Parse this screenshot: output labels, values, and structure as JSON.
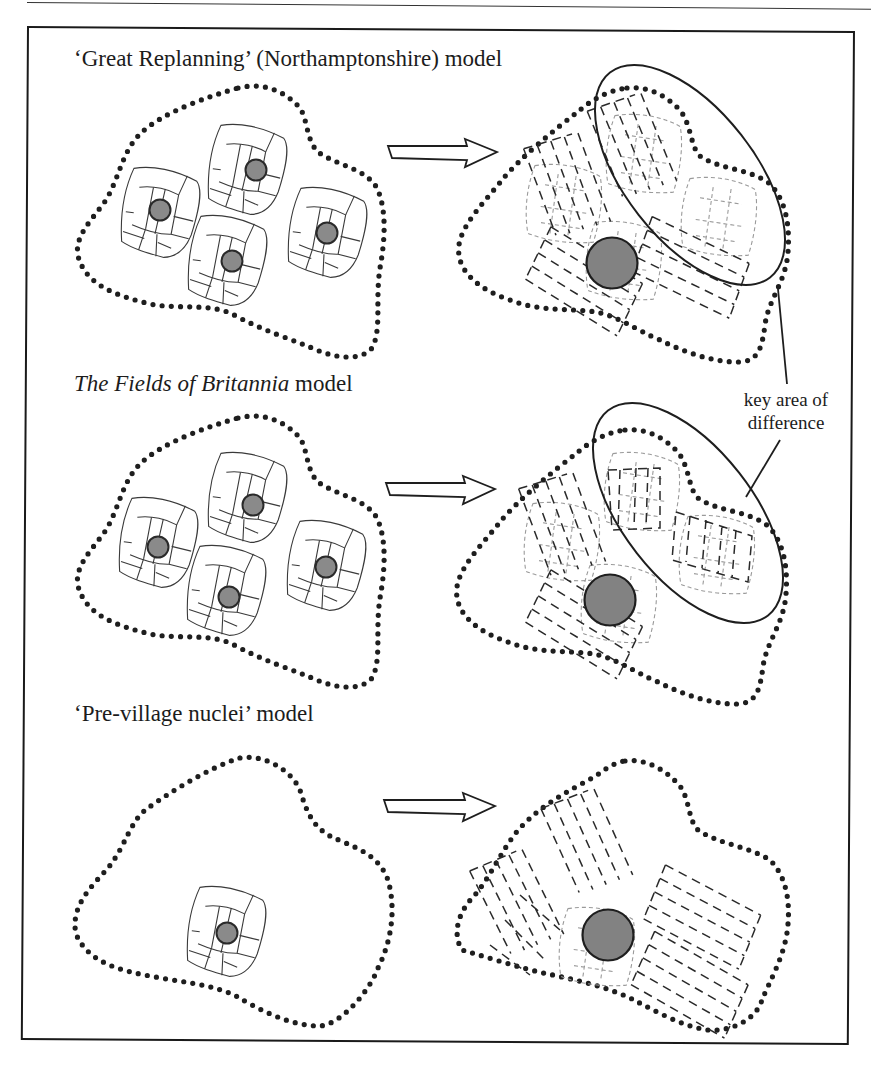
{
  "figure": {
    "sections": [
      {
        "id": "great-replanning",
        "title_prefix": "‘Great Replanning’ (Northamptonshire) model",
        "title_italic": "",
        "title_suffix": "",
        "before": {
          "nuclei_count": 4,
          "description": "four dispersed settlement nuclei with surrounding field blocks inside a dotted township boundary"
        },
        "after": {
          "nucleated_village": 1,
          "description": "single nucleated village with dashed open-field furlongs overlying ghosted earlier fields",
          "highlight": "key area of difference"
        }
      },
      {
        "id": "fields-of-britannia",
        "title_prefix": "",
        "title_italic": "The Fields of Britannia",
        "title_suffix": " model",
        "before": {
          "nuclei_count": 4,
          "description": "four dispersed settlement nuclei with surrounding field blocks inside a dotted township boundary"
        },
        "after": {
          "nucleated_village": 1,
          "description": "single nucleated village; earlier field blocks retained within open-field furlongs",
          "highlight": "key area of difference"
        }
      },
      {
        "id": "pre-village-nuclei",
        "title_prefix": "‘Pre-village nuclei’ model",
        "title_italic": "",
        "title_suffix": "",
        "before": {
          "nuclei_count": 1,
          "description": "single settlement nucleus with field block inside a dotted township boundary"
        },
        "after": {
          "nucleated_village": 1,
          "description": "nucleated village with open-field furlongs across the whole township"
        }
      }
    ],
    "callout": {
      "line1": "key area of",
      "line2": "difference"
    },
    "legend_icons": {
      "boundary": "dotted-boundary-icon",
      "nucleus": "settlement-nucleus-icon",
      "arrow": "transition-arrow-icon"
    },
    "colors": {
      "ink": "#1e1e1e",
      "nucleus_fill": "#858585",
      "ghost_field": "#9a9a9a",
      "background": "#ffffff"
    }
  }
}
